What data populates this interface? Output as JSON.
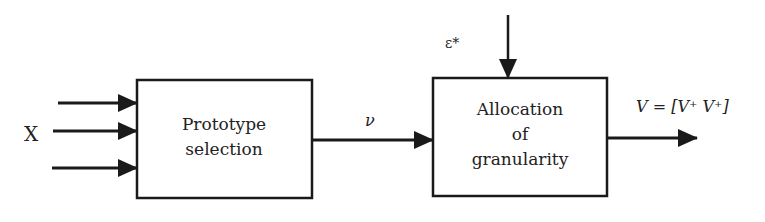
{
  "diagram": {
    "input_label": "X",
    "blocks": [
      {
        "id": "prototype",
        "lines": [
          "Prototype",
          "selection"
        ]
      },
      {
        "id": "allocation",
        "lines": [
          "Allocation",
          "of",
          "granularity"
        ]
      }
    ],
    "intermediate_label": "ν",
    "control_label": "ε*",
    "output_label": "V = [V⁺ V⁺]",
    "colors": {
      "stroke": "#1a1a1a",
      "text": "#222222",
      "background": "#ffffff"
    }
  }
}
